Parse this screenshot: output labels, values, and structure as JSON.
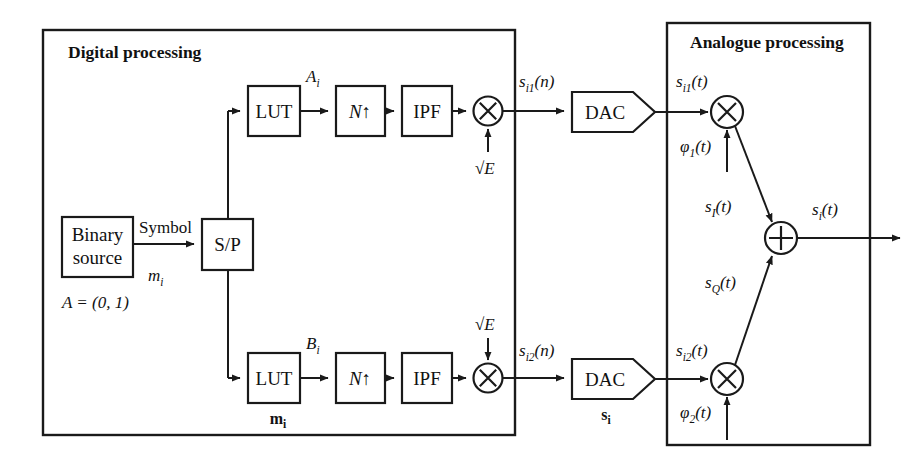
{
  "figure": {
    "type": "block-diagram"
  },
  "sections": {
    "digital": {
      "title": "Digital processing"
    },
    "analogue": {
      "title": "Analogue processing"
    }
  },
  "blocks": {
    "binary_source_line1": "Binary",
    "binary_source_line2": "source",
    "sp": "S/P",
    "lut_upper": "LUT",
    "lut_lower": "LUT",
    "upsample_upper": "N",
    "upsample_upper_arrow": "↑",
    "upsample_lower": "N",
    "upsample_lower_arrow": "↑",
    "ipf_upper": "IPF",
    "ipf_lower": "IPF",
    "dac_upper": "DAC",
    "dac_lower": "DAC",
    "mult_symbol": "×",
    "sum_symbol": "+"
  },
  "labels": {
    "symbol": "Symbol",
    "m_i": "m",
    "m_i_sub": "i",
    "alphabet": "A = (0, 1)",
    "A_i": "A",
    "A_i_sub": "i",
    "B_i": "B",
    "B_i_sub": "i",
    "sqrtE_upper": "√E",
    "sqrtE_lower": "√E",
    "s_i1_n": "s",
    "s_i1_n_sub": "i1",
    "s_i1_n_arg": "(n)",
    "s_i2_n": "s",
    "s_i2_n_sub": "i2",
    "s_i2_n_arg": "(n)",
    "s_i1_t": "s",
    "s_i1_t_sub": "i1",
    "s_i1_t_arg": "(t)",
    "s_i2_t": "s",
    "s_i2_t_sub": "i2",
    "s_i2_t_arg": "(t)",
    "phi1": "φ",
    "phi1_sub": "1",
    "phi1_arg": "(t)",
    "phi2": "φ",
    "phi2_sub": "2",
    "phi2_arg": "(t)",
    "s_I_t": "s",
    "s_I_t_sub": "I",
    "s_I_t_arg": "(t)",
    "s_Q_t": "s",
    "s_Q_t_sub": "Q",
    "s_Q_t_arg": "(t)",
    "s_i_t": "s",
    "s_i_t_sub": "i",
    "s_i_t_arg": "(t)",
    "m_vector": "m",
    "m_vector_sub": "i",
    "s_vector": "s",
    "s_vector_sub": "i"
  },
  "colors": {
    "stroke": "#1a1a1a",
    "text": "#111111",
    "background": "#ffffff"
  }
}
